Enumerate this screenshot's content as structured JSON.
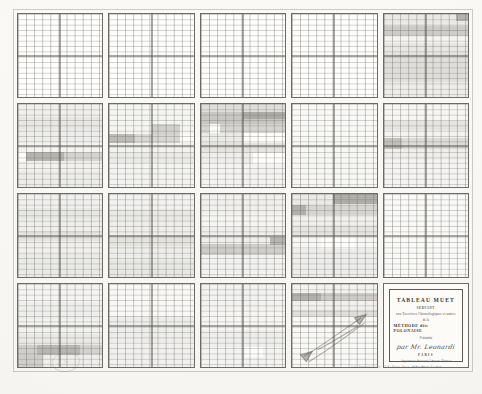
{
  "document": {
    "kind": "lithographed-chart-plate",
    "sheet_color": "#fbfbfa",
    "ink_color": "#55524c",
    "panel_border_color": "#6e6b65"
  },
  "cartouche": {
    "title": "TABLEAU MUET",
    "servant": "SERVANT",
    "purpose": "aux Exercices Chronologiques et autres",
    "de_la": "de la",
    "method": "MÉTHODE dite POLONAISE",
    "presentee": "Présentée",
    "author": "par Mr. Leonardi",
    "city": "PARIS",
    "publisher_line_1": "Imprimerie Bernard, Libraire-Éditeur",
    "publisher_line_2": "18 Rue Bleue, 5.e Arr.t",
    "year": "1864"
  },
  "credit": "Lith. Bernard & C.ie, 18 R. Bleue, Paris.",
  "stamp": "S",
  "grid": {
    "columns": 5,
    "rows": 4,
    "fine_rules_per_panel": {
      "vertical": 11,
      "horizontal": 14
    },
    "quadrant_divider": true
  },
  "chart_data": {
    "type": "heatmap",
    "title": "TABLEAU MUET",
    "xlabel": "",
    "ylabel": "",
    "columns": [
      "1",
      "2",
      "3",
      "4",
      "5"
    ],
    "rows": [
      "A",
      "B",
      "C",
      "D"
    ],
    "panels": [
      {
        "row": 0,
        "col": 0,
        "bands": []
      },
      {
        "row": 0,
        "col": 1,
        "bands": []
      },
      {
        "row": 0,
        "col": 2,
        "bands": []
      },
      {
        "row": 0,
        "col": 3,
        "bands": []
      },
      {
        "row": 0,
        "col": 4,
        "bands": [
          {
            "top": 0.0,
            "height": 0.145,
            "v": 0.3
          },
          {
            "top": 0.145,
            "height": 0.115,
            "v": 0.52
          },
          {
            "top": 0.26,
            "height": 0.095,
            "v": 0.17
          },
          {
            "top": 0.355,
            "height": 0.125,
            "v": 0.33
          },
          {
            "top": 0.48,
            "height": 0.34,
            "v": 0.4
          },
          {
            "top": 0.82,
            "height": 0.18,
            "v": 0.27
          }
        ],
        "blocks": [
          {
            "x": 0.86,
            "y": 0.0,
            "w": 0.14,
            "h": 0.085,
            "v": 0.62
          }
        ]
      },
      {
        "row": 1,
        "col": 0,
        "bands": [
          {
            "top": 0.0,
            "height": 0.16,
            "v": 0.22
          },
          {
            "top": 0.16,
            "height": 0.14,
            "v": 0.33
          },
          {
            "top": 0.3,
            "height": 0.16,
            "v": 0.26
          },
          {
            "top": 0.46,
            "height": 0.115,
            "v": 0.17
          },
          {
            "top": 0.575,
            "height": 0.115,
            "v": 0.47
          },
          {
            "top": 0.69,
            "height": 0.12,
            "v": 0.21
          },
          {
            "top": 0.81,
            "height": 0.19,
            "v": 0.28
          }
        ],
        "blocks": [
          {
            "x": 0.0,
            "y": 0.575,
            "w": 0.1,
            "h": 0.115,
            "v": 0.03
          },
          {
            "x": 0.1,
            "y": 0.575,
            "w": 0.45,
            "h": 0.115,
            "v": 0.58
          }
        ]
      },
      {
        "row": 1,
        "col": 1,
        "bands": [
          {
            "top": 0.0,
            "height": 0.36,
            "v": 0.16
          },
          {
            "top": 0.36,
            "height": 0.115,
            "v": 0.45
          },
          {
            "top": 0.475,
            "height": 0.1,
            "v": 0.2
          },
          {
            "top": 0.575,
            "height": 0.13,
            "v": 0.3
          },
          {
            "top": 0.705,
            "height": 0.295,
            "v": 0.19
          }
        ],
        "blocks": [
          {
            "x": 0.5,
            "y": 0.245,
            "w": 0.34,
            "h": 0.115,
            "v": 0.46
          },
          {
            "x": 0.0,
            "y": 0.36,
            "w": 0.3,
            "h": 0.115,
            "v": 0.52
          },
          {
            "x": 0.84,
            "y": 0.36,
            "w": 0.16,
            "h": 0.115,
            "v": 0.07
          }
        ]
      },
      {
        "row": 1,
        "col": 2,
        "bands": [
          {
            "top": 0.0,
            "height": 0.1,
            "v": 0.4
          },
          {
            "top": 0.1,
            "height": 0.135,
            "v": 0.55
          },
          {
            "top": 0.235,
            "height": 0.11,
            "v": 0.46
          },
          {
            "top": 0.345,
            "height": 0.12,
            "v": 0.3
          },
          {
            "top": 0.465,
            "height": 0.13,
            "v": 0.35
          },
          {
            "top": 0.595,
            "height": 0.125,
            "v": 0.24
          },
          {
            "top": 0.72,
            "height": 0.28,
            "v": 0.18
          }
        ],
        "blocks": [
          {
            "x": 0.5,
            "y": 0.1,
            "w": 0.5,
            "h": 0.085,
            "v": 0.6
          },
          {
            "x": 0.1,
            "y": 0.235,
            "w": 0.13,
            "h": 0.11,
            "v": 0.05
          },
          {
            "x": 0.5,
            "y": 0.345,
            "w": 0.5,
            "h": 0.12,
            "v": 0.06
          },
          {
            "x": 0.62,
            "y": 0.595,
            "w": 0.38,
            "h": 0.125,
            "v": 0.08
          }
        ]
      },
      {
        "row": 1,
        "col": 3,
        "bands": [
          {
            "top": 0.0,
            "height": 0.4,
            "v": 0.09
          },
          {
            "top": 0.4,
            "height": 0.6,
            "v": 0.13
          }
        ],
        "blocks": []
      },
      {
        "row": 1,
        "col": 4,
        "bands": [
          {
            "top": 0.0,
            "height": 0.2,
            "v": 0.14
          },
          {
            "top": 0.2,
            "height": 0.11,
            "v": 0.34
          },
          {
            "top": 0.31,
            "height": 0.1,
            "v": 0.19
          },
          {
            "top": 0.41,
            "height": 0.13,
            "v": 0.42
          },
          {
            "top": 0.54,
            "height": 0.13,
            "v": 0.24
          },
          {
            "top": 0.67,
            "height": 0.33,
            "v": 0.17
          }
        ],
        "blocks": [
          {
            "x": 0.0,
            "y": 0.41,
            "w": 0.22,
            "h": 0.13,
            "v": 0.5
          }
        ]
      },
      {
        "row": 2,
        "col": 0,
        "bands": [
          {
            "top": 0.0,
            "height": 0.17,
            "v": 0.23
          },
          {
            "top": 0.17,
            "height": 0.13,
            "v": 0.33
          },
          {
            "top": 0.3,
            "height": 0.14,
            "v": 0.25
          },
          {
            "top": 0.44,
            "height": 0.13,
            "v": 0.35
          },
          {
            "top": 0.57,
            "height": 0.15,
            "v": 0.22
          },
          {
            "top": 0.72,
            "height": 0.28,
            "v": 0.3
          }
        ],
        "blocks": []
      },
      {
        "row": 2,
        "col": 1,
        "bands": [
          {
            "top": 0.0,
            "height": 0.18,
            "v": 0.2
          },
          {
            "top": 0.18,
            "height": 0.15,
            "v": 0.31
          },
          {
            "top": 0.33,
            "height": 0.16,
            "v": 0.24
          },
          {
            "top": 0.49,
            "height": 0.14,
            "v": 0.36
          },
          {
            "top": 0.63,
            "height": 0.16,
            "v": 0.26
          },
          {
            "top": 0.79,
            "height": 0.21,
            "v": 0.33
          }
        ],
        "blocks": []
      },
      {
        "row": 2,
        "col": 2,
        "bands": [
          {
            "top": 0.0,
            "height": 0.24,
            "v": 0.22
          },
          {
            "top": 0.24,
            "height": 0.16,
            "v": 0.16
          },
          {
            "top": 0.4,
            "height": 0.2,
            "v": 0.24
          },
          {
            "top": 0.6,
            "height": 0.14,
            "v": 0.5
          },
          {
            "top": 0.74,
            "height": 0.26,
            "v": 0.2
          }
        ],
        "blocks": [
          {
            "x": 0.0,
            "y": 0.6,
            "w": 0.42,
            "h": 0.14,
            "v": 0.3
          },
          {
            "x": 0.82,
            "y": 0.52,
            "w": 0.18,
            "h": 0.1,
            "v": 0.62
          }
        ]
      },
      {
        "row": 2,
        "col": 3,
        "bands": [
          {
            "top": 0.0,
            "height": 0.13,
            "v": 0.3
          },
          {
            "top": 0.13,
            "height": 0.12,
            "v": 0.46
          },
          {
            "top": 0.25,
            "height": 0.12,
            "v": 0.22
          },
          {
            "top": 0.37,
            "height": 0.14,
            "v": 0.34
          },
          {
            "top": 0.51,
            "height": 0.15,
            "v": 0.14
          },
          {
            "top": 0.66,
            "height": 0.34,
            "v": 0.26
          }
        ],
        "blocks": [
          {
            "x": 0.48,
            "y": 0.0,
            "w": 0.52,
            "h": 0.125,
            "v": 0.66
          },
          {
            "x": 0.0,
            "y": 0.13,
            "w": 0.16,
            "h": 0.12,
            "v": 0.6
          },
          {
            "x": 0.34,
            "y": 0.51,
            "w": 0.4,
            "h": 0.15,
            "v": 0.07
          }
        ]
      },
      {
        "row": 2,
        "col": 4,
        "bands": [
          {
            "top": 0.0,
            "height": 1.0,
            "v": 0.09
          }
        ],
        "blocks": []
      },
      {
        "row": 3,
        "col": 0,
        "bands": [
          {
            "top": 0.0,
            "height": 0.22,
            "v": 0.17
          },
          {
            "top": 0.22,
            "height": 0.2,
            "v": 0.25
          },
          {
            "top": 0.42,
            "height": 0.18,
            "v": 0.2
          },
          {
            "top": 0.6,
            "height": 0.13,
            "v": 0.31
          },
          {
            "top": 0.73,
            "height": 0.13,
            "v": 0.48
          },
          {
            "top": 0.86,
            "height": 0.14,
            "v": 0.24
          }
        ],
        "blocks": [
          {
            "x": 0.0,
            "y": 0.73,
            "w": 0.22,
            "h": 0.13,
            "v": 0.3
          },
          {
            "x": 0.22,
            "y": 0.73,
            "w": 0.52,
            "h": 0.13,
            "v": 0.55
          },
          {
            "x": 0.0,
            "y": 0.86,
            "w": 0.3,
            "h": 0.14,
            "v": 0.46
          }
        ]
      },
      {
        "row": 3,
        "col": 1,
        "bands": [
          {
            "top": 0.0,
            "height": 0.38,
            "v": 0.1
          },
          {
            "top": 0.38,
            "height": 0.32,
            "v": 0.26
          },
          {
            "top": 0.7,
            "height": 0.3,
            "v": 0.22
          }
        ],
        "blocks": []
      },
      {
        "row": 3,
        "col": 2,
        "bands": [
          {
            "top": 0.0,
            "height": 0.3,
            "v": 0.2
          },
          {
            "top": 0.3,
            "height": 0.26,
            "v": 0.15
          },
          {
            "top": 0.56,
            "height": 0.2,
            "v": 0.25
          },
          {
            "top": 0.76,
            "height": 0.24,
            "v": 0.19
          }
        ],
        "blocks": [
          {
            "x": 0.52,
            "y": 0.76,
            "w": 0.22,
            "h": 0.12,
            "v": 0.06
          }
        ]
      },
      {
        "row": 3,
        "col": 3,
        "bands": [
          {
            "top": 0.0,
            "height": 0.11,
            "v": 0.2
          },
          {
            "top": 0.11,
            "height": 0.1,
            "v": 0.52
          },
          {
            "top": 0.21,
            "height": 0.1,
            "v": 0.22
          },
          {
            "top": 0.31,
            "height": 0.09,
            "v": 0.4
          },
          {
            "top": 0.4,
            "height": 0.6,
            "v": 0.11
          }
        ],
        "blocks": [
          {
            "x": 0.0,
            "y": 0.11,
            "w": 0.34,
            "h": 0.1,
            "v": 0.58
          }
        ],
        "annotation": "handwritten diagonal pen strokes"
      },
      {
        "row": 3,
        "col": 4,
        "is_cartouche": true,
        "bands": []
      }
    ]
  }
}
